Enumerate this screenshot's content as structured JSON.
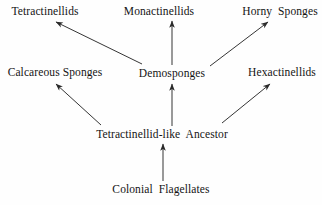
{
  "diagram": {
    "type": "phylogenetic-tree",
    "title": "",
    "background_color": "#fefefe",
    "line_color": "#2a2a2a",
    "text_color": "#141414",
    "nodes": [
      {
        "id": "tetractinellids",
        "label": "Tetractinellids",
        "x": 45,
        "y": 5,
        "tier": "top"
      },
      {
        "id": "monactinellids",
        "label": "Monactinellids",
        "x": 159,
        "y": 5,
        "tier": "top"
      },
      {
        "id": "horny_sponges",
        "label": "Horny  Sponges",
        "x": 280,
        "y": 5,
        "tier": "top"
      },
      {
        "id": "calcareous_sponges",
        "label": "Calcareous Sponges",
        "x": 55,
        "y": 66,
        "tier": "middle"
      },
      {
        "id": "demosponges",
        "label": "Demosponges",
        "x": 172,
        "y": 67,
        "tier": "middle"
      },
      {
        "id": "hexactinellids",
        "label": "Hexactinellids",
        "x": 282,
        "y": 66,
        "tier": "middle"
      },
      {
        "id": "ancestor",
        "label": "Tetractinellid-like  Ancestor",
        "x": 162,
        "y": 128,
        "tier": "lower"
      },
      {
        "id": "colonial_flagellates",
        "label": "Colonial  Flagellates",
        "x": 161,
        "y": 183,
        "tier": "bottom"
      }
    ],
    "edges": [
      {
        "id": "edge-demosponges-to-tetractinellids",
        "from": "demosponges",
        "to": "tetractinellids",
        "x1": 142,
        "y1": 64,
        "x2": 56,
        "y2": 22
      },
      {
        "id": "edge-demosponges-to-monactinellids",
        "from": "demosponges",
        "to": "monactinellids",
        "x1": 172,
        "y1": 65,
        "x2": 172,
        "y2": 21
      },
      {
        "id": "edge-demosponges-to-horny-sponges",
        "from": "demosponges",
        "to": "horny_sponges",
        "x1": 210,
        "y1": 66,
        "x2": 268,
        "y2": 22
      },
      {
        "id": "edge-ancestor-to-calcareous-sponges",
        "from": "ancestor",
        "to": "calcareous_sponges",
        "x1": 101,
        "y1": 125,
        "x2": 56,
        "y2": 84
      },
      {
        "id": "edge-ancestor-to-demosponges",
        "from": "ancestor",
        "to": "demosponges",
        "x1": 172,
        "y1": 126,
        "x2": 172,
        "y2": 84
      },
      {
        "id": "edge-ancestor-to-hexactinellids",
        "from": "ancestor",
        "to": "hexactinellids",
        "x1": 222,
        "y1": 123,
        "x2": 270,
        "y2": 84
      },
      {
        "id": "edge-flagellates-to-ancestor",
        "from": "colonial_flagellates",
        "to": "ancestor",
        "x1": 163,
        "y1": 181,
        "x2": 163,
        "y2": 144
      }
    ]
  }
}
